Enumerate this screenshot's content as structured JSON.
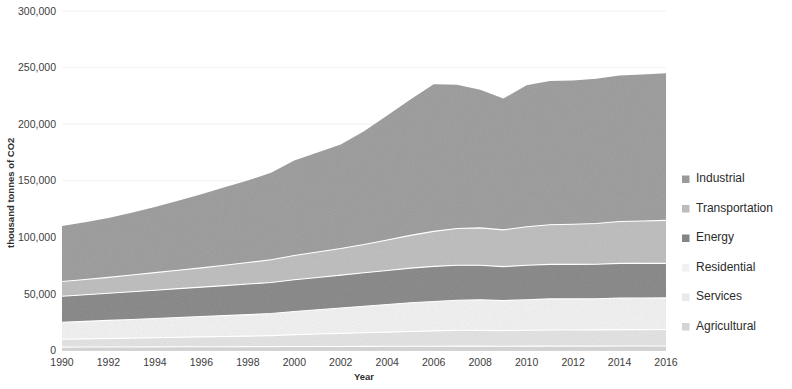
{
  "chart_data": {
    "type": "area",
    "stacked": true,
    "title": "",
    "xlabel": "Year",
    "ylabel": "thousand tonnes of CO2",
    "x": [
      1990,
      1991,
      1992,
      1993,
      1994,
      1995,
      1996,
      1997,
      1998,
      1999,
      2000,
      2001,
      2002,
      2003,
      2004,
      2005,
      2006,
      2007,
      2008,
      2009,
      2010,
      2011,
      2012,
      2013,
      2014,
      2015,
      2016
    ],
    "xticks": [
      1990,
      1992,
      1994,
      1996,
      1998,
      2000,
      2002,
      2004,
      2006,
      2008,
      2010,
      2012,
      2014,
      2016
    ],
    "xtick_labels": [
      "1990",
      "1992",
      "1994",
      "1996",
      "1998",
      "2000",
      "2002",
      "2004",
      "2006",
      "2008",
      "2010",
      "2012",
      "2014",
      "2016"
    ],
    "yticks": [
      0,
      50000,
      100000,
      150000,
      200000,
      250000,
      300000
    ],
    "ytick_labels": [
      "0",
      "50,000",
      "100,000",
      "150,000",
      "200,000",
      "250,000",
      "300,000"
    ],
    "ylim": [
      0,
      300000
    ],
    "xlim": [
      1990,
      2016
    ],
    "grid": true,
    "legend_position": "right",
    "stack_order_bottom_to_top": [
      "Agricultural",
      "Services",
      "Residential",
      "Energy",
      "Transportation",
      "Industrial"
    ],
    "series": [
      {
        "name": "Industrial",
        "color": "#9a9a9a",
        "values": [
          49000,
          50500,
          52500,
          55000,
          58000,
          61500,
          65000,
          69000,
          72500,
          77000,
          84000,
          88000,
          92000,
          100000,
          110000,
          120000,
          130000,
          127000,
          122000,
          116000,
          125000,
          127000,
          127000,
          128000,
          129000,
          129500,
          130000
        ]
      },
      {
        "name": "Transportation",
        "color": "#bcbcbc",
        "values": [
          13000,
          13500,
          14000,
          14800,
          15500,
          16200,
          17000,
          18000,
          19000,
          20000,
          21500,
          22500,
          23500,
          25000,
          27000,
          29000,
          31000,
          32500,
          33000,
          32500,
          34000,
          35000,
          35500,
          36000,
          37000,
          37500,
          38000
        ]
      },
      {
        "name": "Energy",
        "color": "#858585",
        "values": [
          23000,
          23500,
          24000,
          24500,
          25000,
          25500,
          26000,
          26500,
          27000,
          27500,
          28000,
          28500,
          29000,
          29500,
          30000,
          30500,
          31000,
          31000,
          30500,
          30000,
          30500,
          30500,
          30500,
          30500,
          30500,
          30500,
          30500
        ]
      },
      {
        "name": "Residential",
        "color": "#f1f1f1",
        "values": [
          15000,
          15500,
          16000,
          16500,
          17000,
          17500,
          18000,
          18500,
          19000,
          19500,
          20500,
          21500,
          22500,
          23500,
          24500,
          25500,
          26000,
          26500,
          27000,
          26500,
          27000,
          27500,
          27500,
          27500,
          28000,
          28000,
          28000
        ]
      },
      {
        "name": "Services",
        "color": "#e2e2e2",
        "values": [
          7000,
          7200,
          7500,
          7800,
          8100,
          8400,
          8700,
          9000,
          9300,
          9700,
          10500,
          11000,
          11500,
          12000,
          12500,
          13000,
          13500,
          14000,
          14000,
          13800,
          14000,
          14200,
          14200,
          14300,
          14500,
          14500,
          14500
        ]
      },
      {
        "name": "Agricultural",
        "color": "#d4d4d4",
        "values": [
          3000,
          3050,
          3100,
          3150,
          3200,
          3250,
          3300,
          3350,
          3400,
          3450,
          3500,
          3550,
          3600,
          3650,
          3700,
          3750,
          3800,
          3850,
          3850,
          3800,
          3850,
          3900,
          3900,
          3900,
          3950,
          3950,
          4000
        ]
      }
    ],
    "totals": [
      110000,
      113250,
      117100,
      122750,
      126800,
      132350,
      138000,
      144350,
      150200,
      157150,
      168000,
      175050,
      182100,
      193650,
      208700,
      221750,
      235300,
      234850,
      230350,
      222600,
      234350,
      238600,
      238600,
      240200,
      243950,
      245450,
      247000
    ]
  },
  "axes": {
    "y_title": "thousand tonnes of CO2",
    "x_title": "Year"
  },
  "legend": {
    "items": [
      {
        "label": "Industrial",
        "color": "#9a9a9a"
      },
      {
        "label": "Transportation",
        "color": "#bcbcbc"
      },
      {
        "label": "Energy",
        "color": "#858585"
      },
      {
        "label": "Residential",
        "color": "#f1f1f1"
      },
      {
        "label": "Services",
        "color": "#e9e9e9"
      },
      {
        "label": "Agricultural",
        "color": "#d4d4d4"
      }
    ]
  }
}
